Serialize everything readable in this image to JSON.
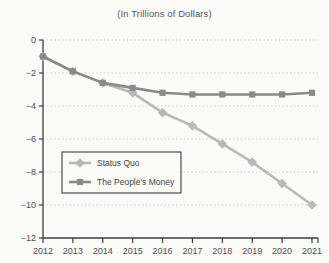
{
  "chart_data": {
    "type": "line",
    "title": "(In Trillions of Dollars)",
    "xlabel": "",
    "ylabel": "",
    "categories": [
      "2012",
      "2013",
      "2014",
      "2015",
      "2016",
      "2017",
      "2018",
      "2019",
      "2020",
      "2021"
    ],
    "series": [
      {
        "name": "Status Quo",
        "color": "#b9b9b9",
        "marker": "diamond",
        "values": [
          -1.0,
          -1.9,
          -2.6,
          -3.2,
          -4.4,
          -5.2,
          -6.3,
          -7.4,
          -8.7,
          -10.0
        ]
      },
      {
        "name": "The People's Money",
        "color": "#8a8a8a",
        "marker": "square",
        "values": [
          -1.0,
          -1.9,
          -2.6,
          -2.9,
          -3.2,
          -3.3,
          -3.3,
          -3.3,
          -3.3,
          -3.2
        ]
      }
    ],
    "ylim": [
      -12,
      0
    ],
    "yticks": [
      0,
      -2,
      -4,
      -6,
      -8,
      -10,
      -12
    ],
    "ytick_labels": [
      "0",
      "−2",
      "−4",
      "−6",
      "−8",
      "−10",
      "−12"
    ],
    "grid": true,
    "grid_style": "dotted",
    "grid_color": "#c9c9c9",
    "legend_position": "lower-left",
    "axis_color": "#3c3c40",
    "background": "#fbfbfa"
  },
  "legend": {
    "items": [
      {
        "label": "Status Quo"
      },
      {
        "label": "The People's Money"
      }
    ]
  }
}
